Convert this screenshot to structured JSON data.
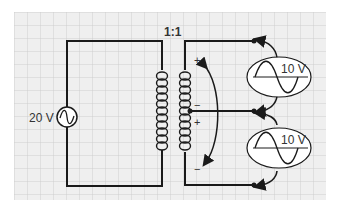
{
  "diagram": {
    "type": "circuit",
    "transformer_ratio": "1:1",
    "source": {
      "label": "20 V",
      "symbol": "ac-source"
    },
    "outputs": [
      {
        "label": "10 V",
        "position": "upper"
      },
      {
        "label": "10 V",
        "position": "lower"
      }
    ],
    "polarity_marks": [
      "+",
      "−",
      "+",
      "−"
    ],
    "colors": {
      "wire": "#1a1a1a",
      "grid_minor": "#cfcfcf",
      "grid_bg": "#efefef",
      "text": "#333333",
      "meter_fill": "#ffffff"
    }
  }
}
